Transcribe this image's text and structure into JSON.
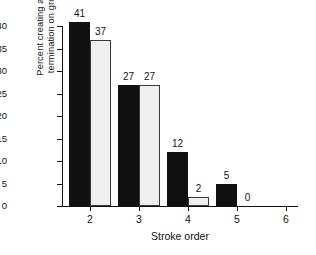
{
  "chart_data": {
    "type": "bar",
    "title": "",
    "xlabel": "Stroke order",
    "ylabel": "Percent creating a new\ntermination on ground",
    "categories": [
      "2",
      "3",
      "4",
      "5",
      "6"
    ],
    "ylim": [
      0,
      40
    ],
    "yticks": [
      "0",
      "5",
      "10",
      "15",
      "20",
      "25",
      "30",
      "35",
      "40"
    ],
    "grid": false,
    "legend": "none",
    "series": [
      {
        "name": "series-1-dark",
        "color": "#111111",
        "values": [
          41,
          27,
          12,
          5,
          0
        ]
      },
      {
        "name": "series-2-light",
        "color": "#efefef",
        "values": [
          37,
          27,
          2,
          0,
          0
        ]
      }
    ],
    "bar_labels": {
      "series1": [
        "41",
        "27",
        "12",
        "5",
        ""
      ],
      "series2": [
        "37",
        "27",
        "2",
        "0",
        ""
      ]
    }
  }
}
